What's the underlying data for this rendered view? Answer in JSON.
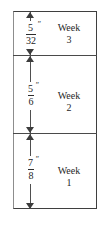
{
  "figure": {
    "colors": {
      "line": "#3f3f3f",
      "divider": "#4a4a4a",
      "arrow": "#3d3d3d",
      "text": "#1f1f1f",
      "background": "#ffffff"
    }
  },
  "units": {
    "inch_mark": "″"
  },
  "sections": [
    {
      "id": "week-3",
      "week_label": "Week",
      "week_number": "3",
      "measurement": {
        "numerator": "5",
        "denominator": "32",
        "unit": "″",
        "text": "5/32″"
      }
    },
    {
      "id": "week-2",
      "week_label": "Week",
      "week_number": "2",
      "measurement": {
        "numerator": "5",
        "denominator": "6",
        "unit": "″",
        "text": "5/6″"
      }
    },
    {
      "id": "week-1",
      "week_label": "Week",
      "week_number": "1",
      "measurement": {
        "numerator": "7",
        "denominator": "8",
        "unit": "″",
        "text": "7/8″"
      }
    }
  ]
}
